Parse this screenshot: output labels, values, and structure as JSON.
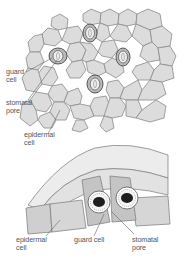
{
  "top_diagram": {
    "title": "Surface view of leaf epidermis",
    "labels": {
      "guard_cell": [
        "guard",
        "cell"
      ],
      "stomatal_pore": [
        "stomatal",
        "pore"
      ],
      "epidermal_cell": [
        "epidermal",
        "cell"
      ]
    },
    "stomata_count": 4
  },
  "bottom_diagram": {
    "title": "Cross-section of stoma",
    "labels": {
      "epidermal_cell": [
        "epidermal",
        "cell"
      ],
      "guard_cell": [
        "guard cell"
      ],
      "stomatal_pore": [
        "stomatal",
        "pore"
      ]
    }
  },
  "colors": {
    "cell_fill": "#dcdcdc",
    "cell_stroke": "#8a8a8a",
    "guard_fill": "#b9b9b9",
    "guard_stroke": "#555555",
    "label_text": "#555555",
    "nucleus": "#1e1e1e"
  }
}
